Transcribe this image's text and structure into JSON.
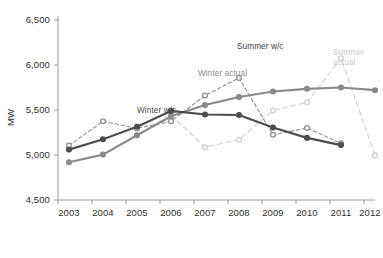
{
  "axis": {
    "y_title": "MW",
    "y_ticks": [
      "4,500",
      "5,000",
      "5,500",
      "6,000",
      "6,500"
    ],
    "x_ticks": [
      "2003",
      "2004",
      "2005",
      "2006",
      "2007",
      "2008",
      "2009",
      "2010",
      "2011",
      "2012"
    ]
  },
  "annotations": {
    "winter_wc": "Winter w/c",
    "winter_actual": "Winter actual",
    "summer_wc": "Summer w/c",
    "summer_actual_line1": "Summer",
    "summer_actual_line2": "actual"
  },
  "colors": {
    "winter_wc": "#4d4d4d",
    "winter_actual": "#8f8f8f",
    "summer_wc": "#8a8a8a",
    "summer_actual": "#cfcfcf",
    "axis": "#9a9a9a",
    "text": "#2f2f2f"
  },
  "chart_data": {
    "type": "line",
    "title": "",
    "xlabel": "",
    "ylabel": "MW",
    "ylim": [
      4500,
      6500
    ],
    "ytick_step": 500,
    "grid": false,
    "legend_position": "inline-annotations",
    "x": [
      "2003",
      "2004",
      "2005",
      "2006",
      "2007",
      "2008",
      "2009",
      "2010",
      "2011",
      "2012"
    ],
    "series": [
      {
        "name": "Winter w/c",
        "style": "solid",
        "color": "#4d4d4d",
        "marker": "filled-circle",
        "values": [
          5060,
          5175,
          5315,
          5490,
          5450,
          5445,
          5305,
          5190,
          5110,
          null
        ]
      },
      {
        "name": "Winter actual",
        "style": "dashed",
        "color": "#8f8f8f",
        "marker": "open-circle",
        "values": [
          5105,
          5375,
          5295,
          5375,
          5660,
          5855,
          5225,
          5300,
          5130,
          null
        ]
      },
      {
        "name": "Summer w/c",
        "style": "solid",
        "color": "#8a8a8a",
        "marker": "filled-circle",
        "values": [
          4920,
          5005,
          5220,
          5430,
          5555,
          5645,
          5705,
          5735,
          5750,
          5720
        ]
      },
      {
        "name": "Summer actual",
        "style": "dashed",
        "color": "#cfcfcf",
        "marker": "open-circle",
        "values": [
          null,
          null,
          null,
          5445,
          5085,
          5170,
          5495,
          5585,
          6075,
          4995
        ]
      }
    ]
  }
}
